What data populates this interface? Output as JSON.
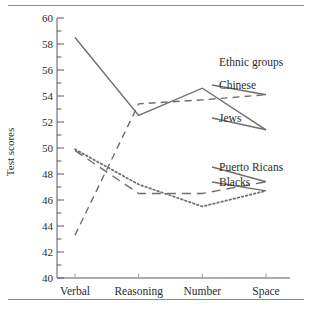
{
  "chart_data": {
    "type": "line",
    "title": "",
    "xlabel": "",
    "ylabel": "Test scores",
    "categories": [
      "Verbal",
      "Reasoning",
      "Number",
      "Space"
    ],
    "ylim": [
      40,
      60
    ],
    "ytick_step_major": 2,
    "ytick_step_minor": 1,
    "ytick_labels": [
      "40",
      "42",
      "44",
      "46",
      "48",
      "50",
      "52",
      "54",
      "56",
      "58",
      "60"
    ],
    "grid": false,
    "legend_position": "right",
    "legend_title": "Ethnic groups",
    "series": [
      {
        "name": "Jews",
        "style": "solid",
        "color": "#6e6e6e",
        "values": [
          58.5,
          52.5,
          54.6,
          51.4
        ]
      },
      {
        "name": "Chinese",
        "style": "dashed",
        "color": "#6e6e6e",
        "values": [
          43.3,
          53.4,
          53.7,
          54.1
        ]
      },
      {
        "name": "Puerto Ricans",
        "style": "longdash",
        "color": "#6e6e6e",
        "values": [
          49.8,
          46.5,
          46.5,
          47.4
        ]
      },
      {
        "name": "Blacks",
        "style": "dotted",
        "color": "#6e6e6e",
        "values": [
          49.9,
          47.2,
          45.5,
          46.7
        ]
      }
    ]
  },
  "legend": {
    "title": "Ethnic groups",
    "entries": [
      {
        "label": "Chinese"
      },
      {
        "label": "Jews"
      },
      {
        "label": "Puerto Ricans"
      },
      {
        "label": "Blacks"
      }
    ]
  },
  "axes": {
    "y_title": "Test scores",
    "y_ticks": [
      "60",
      "58",
      "56",
      "54",
      "52",
      "50",
      "48",
      "46",
      "44",
      "42",
      "40"
    ],
    "x_ticks": [
      "Verbal",
      "Reasoning",
      "Number",
      "Space"
    ]
  },
  "colors": {
    "line": "#6e6e6e",
    "axis": "#5a5a5a",
    "rule": "#8a8a8a",
    "text": "#2b2b2b",
    "background": "#ffffff"
  }
}
